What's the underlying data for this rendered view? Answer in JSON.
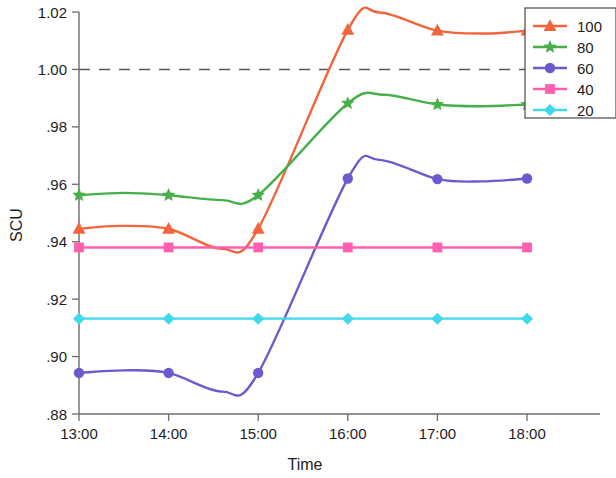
{
  "chart_data": {
    "type": "line",
    "title": "",
    "xlabel": "Time",
    "ylabel": "SCU",
    "x": [
      "13:00",
      "14:00",
      "15:00",
      "16:00",
      "17:00",
      "18:00"
    ],
    "xtick_labels": [
      "13:00",
      "14:00",
      "15:00",
      "16:00",
      "17:00",
      "18:00"
    ],
    "ytick_labels": [
      "1.02",
      "1.00",
      ".98",
      ".96",
      ".94",
      ".92",
      ".90",
      ".88"
    ],
    "ytick_values": [
      1.02,
      1.0,
      0.98,
      0.96,
      0.94,
      0.92,
      0.9,
      0.88
    ],
    "ylim": [
      0.88,
      1.02
    ],
    "xlim": [
      13,
      18
    ],
    "grid": false,
    "legend_position": "top-right",
    "reference_line": {
      "value": 1.0,
      "style": "dashed",
      "color": "#555555"
    },
    "series": [
      {
        "name": "100",
        "label": "100",
        "color": "#f4643c",
        "marker": "triangle",
        "values": [
          0.9445,
          0.9445,
          0.9445,
          1.0138,
          1.0135,
          1.0135
        ],
        "curve_extrema": [
          {
            "x": 13.45,
            "y": 0.9455
          },
          {
            "x": 14.6,
            "y": 0.9375
          },
          {
            "x": 16.35,
            "y": 1.0198
          },
          {
            "x": 17.55,
            "y": 1.0125
          }
        ]
      },
      {
        "name": "80",
        "label": "80",
        "color": "#47b04b",
        "marker": "star",
        "values": [
          0.9562,
          0.9562,
          0.9562,
          0.9882,
          0.9878,
          0.9878
        ],
        "curve_extrema": [
          {
            "x": 13.5,
            "y": 0.957
          },
          {
            "x": 14.6,
            "y": 0.9545
          },
          {
            "x": 16.4,
            "y": 0.9912
          },
          {
            "x": 17.5,
            "y": 0.9872
          }
        ]
      },
      {
        "name": "60",
        "label": "60",
        "color": "#6a5acd",
        "marker": "circle",
        "values": [
          0.8943,
          0.8943,
          0.8943,
          0.962,
          0.9618,
          0.962
        ],
        "curve_extrema": [
          {
            "x": 13.5,
            "y": 0.8952
          },
          {
            "x": 14.6,
            "y": 0.8878
          },
          {
            "x": 16.35,
            "y": 0.9685
          },
          {
            "x": 17.5,
            "y": 0.961
          }
        ]
      },
      {
        "name": "40",
        "label": "40",
        "color": "#ff5fae",
        "marker": "square",
        "values": [
          0.938,
          0.938,
          0.938,
          0.938,
          0.938,
          0.938
        ],
        "curve_extrema": []
      },
      {
        "name": "20",
        "label": "20",
        "color": "#3fd8ed",
        "marker": "diamond",
        "values": [
          0.9132,
          0.9132,
          0.9132,
          0.9132,
          0.9132,
          0.9132
        ],
        "curve_extrema": []
      }
    ]
  }
}
